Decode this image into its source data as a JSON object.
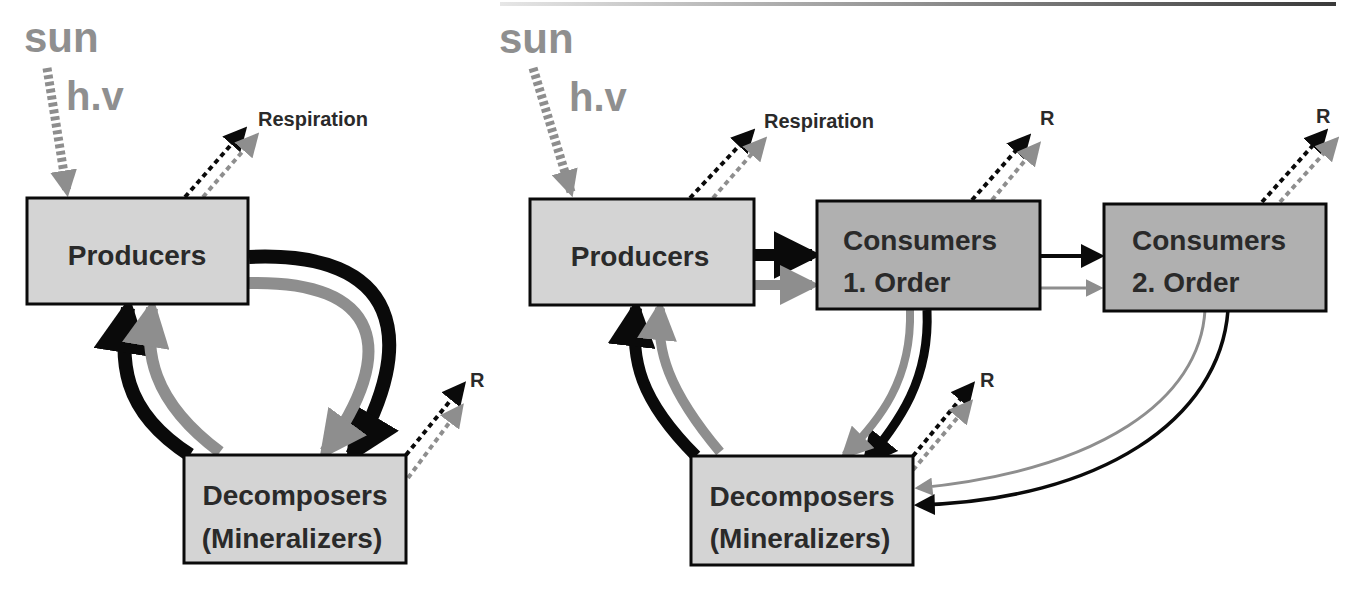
{
  "colors": {
    "box_light": "#d4d4d4",
    "box_dark": "#b0b0b0",
    "flow_black": "#0a0a0a",
    "flow_gray": "#8e8e8e",
    "text": "#2a2a2a",
    "sun_text": "#8f8f8f"
  },
  "left_diagram": {
    "sun_label": "sun",
    "energy_label": "h.v",
    "respiration_label": "Respiration",
    "decomposer_r_label": "R",
    "producers": {
      "label": "Producers"
    },
    "decomposers": {
      "line1": "Decomposers",
      "line2": "(Mineralizers)"
    }
  },
  "right_diagram": {
    "sun_label": "sun",
    "energy_label": "h.v",
    "respiration_label": "Respiration",
    "consumer1_r_label": "R",
    "consumer2_r_label": "R",
    "decomposer_r_label": "R",
    "producers": {
      "label": "Producers"
    },
    "consumers1": {
      "line1": "Consumers",
      "line2": "1. Order"
    },
    "consumers2": {
      "line1": "Consumers",
      "line2": "2. Order"
    },
    "decomposers": {
      "line1": "Decomposers",
      "line2": "(Mineralizers)"
    }
  }
}
